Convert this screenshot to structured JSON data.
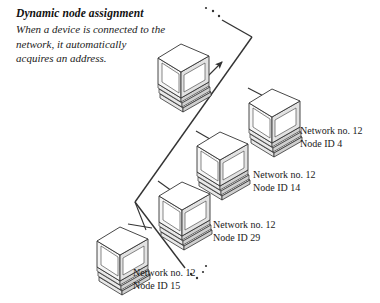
{
  "figure": {
    "caption_title": "Dynamic node assignment",
    "caption_body": "When a device is connected to the network, it automatically acquires an address.",
    "backbone_label": "network-backbone-line",
    "colors": {
      "ink": "#1a1a1a",
      "line": "#333333",
      "shade": "#b0b0b0",
      "background": "#ffffff"
    }
  },
  "nodes": [
    {
      "id": "node-new-device",
      "icon": "computer-isometric-icon",
      "network_line": "",
      "node_line": "",
      "has_label": false,
      "arrow": "arrow-to-network"
    },
    {
      "id": "node-id-4",
      "icon": "computer-isometric-icon",
      "network_line": "Network no. 12",
      "node_line": "Node ID 4",
      "has_label": true
    },
    {
      "id": "node-id-14",
      "icon": "computer-isometric-icon",
      "network_line": "Network no. 12",
      "node_line": "Node ID 14",
      "has_label": true
    },
    {
      "id": "node-id-29",
      "icon": "computer-isometric-icon",
      "network_line": "Network no. 12",
      "node_line": "Node ID 29",
      "has_label": true
    },
    {
      "id": "node-id-15",
      "icon": "computer-isometric-icon",
      "network_line": "Network no. 12",
      "node_line": "Node ID 15",
      "has_label": true
    }
  ]
}
